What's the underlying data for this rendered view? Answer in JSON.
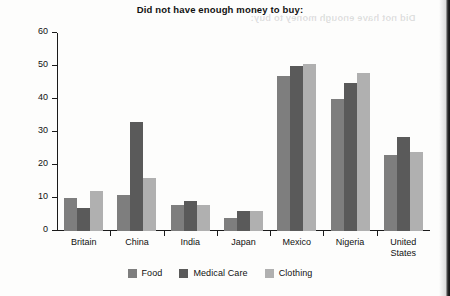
{
  "chart_data": {
    "type": "bar",
    "title": "Did not have enough money to buy:",
    "xlabel": "",
    "ylabel": "",
    "ylim": [
      0,
      60
    ],
    "yticks": [
      0,
      10,
      20,
      30,
      40,
      50,
      60
    ],
    "grid": false,
    "legend_position": "bottom",
    "categories": [
      "Britain",
      "China",
      "India",
      "Japan",
      "Mexico",
      "Nigeria",
      "United\nStates"
    ],
    "series": [
      {
        "name": "Food",
        "color": "#7e7e7e",
        "values": [
          10,
          11,
          8,
          4,
          47,
          40,
          23
        ]
      },
      {
        "name": "Medical Care",
        "color": "#5a5a5a",
        "values": [
          7,
          33,
          9,
          6,
          50,
          45,
          28.5
        ]
      },
      {
        "name": "Clothing",
        "color": "#b0b0b0",
        "values": [
          12,
          16,
          8,
          6,
          50.5,
          48,
          24
        ]
      }
    ]
  },
  "artifacts": {
    "bleed_through_text": "Did not have enough money to buy:"
  }
}
